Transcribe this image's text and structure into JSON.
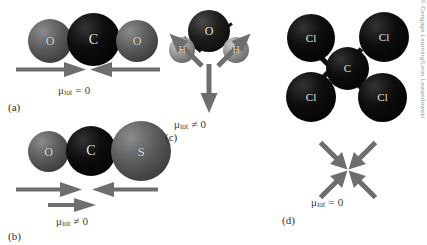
{
  "figure": {
    "credit": "© Cengage Learning/Leon Lewandowski"
  },
  "panels": [
    {
      "id": "a",
      "label": "(a)",
      "molecule": "carbon dioxide",
      "formula": "CO2",
      "mu_text": "μ",
      "mu_sub": "tot",
      "mu_rel": "= 0",
      "atoms": [
        {
          "name": "oxygen-left",
          "label": "O"
        },
        {
          "name": "carbon-center",
          "label": "C"
        },
        {
          "name": "oxygen-right",
          "label": "O"
        }
      ]
    },
    {
      "id": "b",
      "label": "(b)",
      "molecule": "carbonyl sulfide",
      "formula": "OCS",
      "mu_text": "μ",
      "mu_sub": "tot",
      "mu_rel": "≠ 0",
      "atoms": [
        {
          "name": "oxygen-left",
          "label": "O"
        },
        {
          "name": "carbon-center",
          "label": "C"
        },
        {
          "name": "sulfur-right",
          "label": "S"
        }
      ]
    },
    {
      "id": "c",
      "label": "(c)",
      "molecule": "water",
      "formula": "H2O",
      "mu_text": "μ",
      "mu_sub": "tot",
      "mu_rel": "≠ 0",
      "atoms": [
        {
          "name": "oxygen-top",
          "label": "O"
        },
        {
          "name": "hydrogen-left",
          "label": "H"
        },
        {
          "name": "hydrogen-right",
          "label": "H"
        }
      ]
    },
    {
      "id": "d",
      "label": "(d)",
      "molecule": "carbon tetrachloride",
      "formula": "CCl4",
      "mu_text": "μ",
      "mu_sub": "tot",
      "mu_rel": "= 0",
      "atoms": [
        {
          "name": "chlorine-top-left",
          "label": "Cl"
        },
        {
          "name": "chlorine-top-right",
          "label": "Cl"
        },
        {
          "name": "carbon-center",
          "label": "C"
        },
        {
          "name": "chlorine-bottom-left",
          "label": "Cl"
        },
        {
          "name": "chlorine-bottom-right",
          "label": "Cl"
        }
      ]
    }
  ],
  "colors": {
    "arrow": "#6e6e6e",
    "bond": "#101010",
    "background": "#ffffff",
    "caption": "#3a3a3a"
  }
}
